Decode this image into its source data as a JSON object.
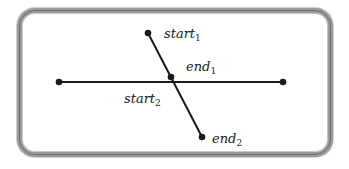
{
  "diagram": {
    "title": "",
    "line_color": "#1a1a1a",
    "frame_color": "#9a9a9a",
    "segments": [
      {
        "name": "horizontal-segment",
        "x1": 59,
        "y1": 82,
        "x2": 283,
        "y2": 82
      },
      {
        "name": "diagonal-segment",
        "x1": 148,
        "y1": 33,
        "x2": 202,
        "y2": 137
      }
    ],
    "points": [
      {
        "name": "horizontal-left-endpoint",
        "x": 59,
        "y": 82
      },
      {
        "name": "horizontal-right-endpoint",
        "x": 283,
        "y": 82
      },
      {
        "name": "start1-point",
        "x": 148,
        "y": 33
      },
      {
        "name": "end1-point",
        "x": 171,
        "y": 77
      },
      {
        "name": "end2-point",
        "x": 202,
        "y": 137
      }
    ],
    "labels": {
      "start1": {
        "base": "start",
        "sub": "1"
      },
      "end1": {
        "base": "end",
        "sub": "1"
      },
      "start2": {
        "base": "start",
        "sub": "2"
      },
      "end2": {
        "base": "end",
        "sub": "2"
      }
    }
  }
}
